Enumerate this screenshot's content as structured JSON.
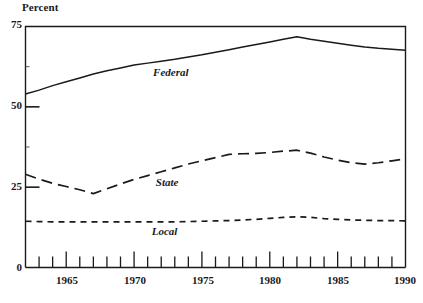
{
  "chart_data": {
    "type": "line",
    "title": "",
    "subtitle": "",
    "ylabel": "Percent",
    "xlabel": "",
    "ylim": [
      0,
      75
    ],
    "xlim": [
      1962,
      1990
    ],
    "grid": false,
    "legend_position": "inline-annotations",
    "yticks": [
      0,
      25,
      50,
      75
    ],
    "ytick_labels": [
      "0",
      "25",
      "50",
      "75"
    ],
    "xticks": [
      1962,
      1963,
      1964,
      1965,
      1966,
      1967,
      1968,
      1969,
      1970,
      1971,
      1972,
      1973,
      1974,
      1975,
      1976,
      1977,
      1978,
      1979,
      1980,
      1981,
      1982,
      1983,
      1984,
      1985,
      1986,
      1987,
      1988,
      1989,
      1990
    ],
    "xtick_labels_shown": [
      "1965",
      "1970",
      "1975",
      "1980",
      "1985",
      "1990"
    ],
    "xtick_label_years": [
      1965,
      1970,
      1975,
      1980,
      1985,
      1990
    ],
    "x": [
      1962,
      1963,
      1964,
      1965,
      1966,
      1967,
      1968,
      1969,
      1970,
      1971,
      1972,
      1973,
      1974,
      1975,
      1976,
      1977,
      1978,
      1979,
      1980,
      1981,
      1982,
      1983,
      1984,
      1985,
      1986,
      1987,
      1988,
      1989,
      1990
    ],
    "series": [
      {
        "name": "Federal",
        "style": "solid",
        "color": "#1a1a1a",
        "label_x": 1971.4,
        "label_y": 60.5,
        "values": [
          54.0,
          55.2,
          56.6,
          57.8,
          59.0,
          60.2,
          61.2,
          62.1,
          63.0,
          63.6,
          64.2,
          64.8,
          65.5,
          66.2,
          67.0,
          67.8,
          68.6,
          69.4,
          70.2,
          71.0,
          71.8,
          71.0,
          70.4,
          69.8,
          69.2,
          68.6,
          68.2,
          67.9,
          67.6
        ]
      },
      {
        "name": "State",
        "style": "long-dash",
        "color": "#1a1a1a",
        "label_x": 1971.6,
        "label_y": 26.4,
        "values": [
          29.0,
          27.5,
          26.2,
          25.2,
          24.2,
          23.0,
          24.5,
          26.0,
          27.4,
          28.6,
          29.8,
          31.0,
          32.2,
          33.2,
          34.2,
          35.2,
          35.4,
          35.5,
          35.8,
          36.2,
          36.5,
          35.6,
          34.4,
          33.4,
          32.6,
          32.2,
          32.6,
          33.2,
          33.8
        ]
      },
      {
        "name": "Local",
        "style": "short-dash",
        "color": "#1a1a1a",
        "label_x": 1971.3,
        "label_y": 11.2,
        "values": [
          14.4,
          14.3,
          14.2,
          14.2,
          14.2,
          14.2,
          14.2,
          14.2,
          14.2,
          14.2,
          14.2,
          14.2,
          14.3,
          14.4,
          14.5,
          14.6,
          14.8,
          15.0,
          15.3,
          15.6,
          15.8,
          15.6,
          15.2,
          15.0,
          14.8,
          14.7,
          14.6,
          14.6,
          14.5
        ]
      }
    ]
  },
  "axis": {
    "ylabel_text": "Percent",
    "ytick_labels": [
      "75",
      "50",
      "25",
      "0"
    ],
    "xtick_labels": [
      "1965",
      "1970",
      "1975",
      "1980",
      "1985",
      "1990"
    ]
  },
  "series_labels": {
    "federal": "Federal",
    "state": "State",
    "local": "Local"
  }
}
